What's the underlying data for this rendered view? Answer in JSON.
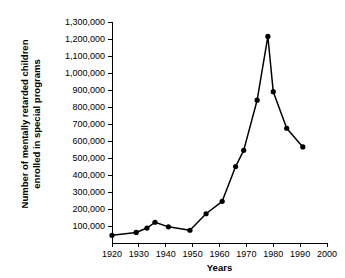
{
  "chart_data": {
    "type": "line",
    "title": "",
    "xlabel": "Years",
    "ylabel": "Number of mentally retarded children enrolled in special programs",
    "ylabel_line1": "Number of mentally retarded children",
    "ylabel_line2": "enrolled in special programs",
    "xlim": [
      1920,
      2000
    ],
    "ylim": [
      0,
      1300000
    ],
    "grid": false,
    "legend": "none",
    "xticks": [
      1920,
      1930,
      1940,
      1950,
      1960,
      1970,
      1980,
      1990,
      2000
    ],
    "xtick_labels": [
      "1920",
      "1930",
      "1940",
      "1950",
      "1960",
      "1970",
      "1980",
      "1990",
      "2000"
    ],
    "yticks": [
      100000,
      200000,
      300000,
      400000,
      500000,
      600000,
      700000,
      800000,
      900000,
      1000000,
      1100000,
      1200000,
      1300000
    ],
    "ytick_labels": [
      "100,000",
      "200,000",
      "300,000",
      "400,000",
      "500,000",
      "600,000",
      "700,000",
      "800,000",
      "900,000",
      "1,000,000",
      "1,100,000",
      "1,200,000",
      "1,300,000"
    ],
    "x": [
      1920,
      1929,
      1933,
      1936,
      1941,
      1949,
      1955,
      1961,
      1966,
      1969,
      1974,
      1978,
      1980,
      1985,
      1991
    ],
    "values": [
      45000,
      62000,
      88000,
      122000,
      95000,
      75000,
      172000,
      245000,
      450000,
      545000,
      840000,
      1215000,
      890000,
      675000,
      565000
    ],
    "series": [
      {
        "name": "Enrollment",
        "color": "#000000",
        "marker": "filled-circle",
        "points": [
          {
            "year": 1920,
            "value": 45000
          },
          {
            "year": 1929,
            "value": 62000
          },
          {
            "year": 1933,
            "value": 88000
          },
          {
            "year": 1936,
            "value": 122000
          },
          {
            "year": 1941,
            "value": 95000
          },
          {
            "year": 1949,
            "value": 75000
          },
          {
            "year": 1955,
            "value": 172000
          },
          {
            "year": 1961,
            "value": 245000
          },
          {
            "year": 1966,
            "value": 450000
          },
          {
            "year": 1969,
            "value": 545000
          },
          {
            "year": 1974,
            "value": 840000
          },
          {
            "year": 1978,
            "value": 1215000
          },
          {
            "year": 1980,
            "value": 890000
          },
          {
            "year": 1985,
            "value": 675000
          },
          {
            "year": 1991,
            "value": 565000
          }
        ]
      }
    ]
  }
}
